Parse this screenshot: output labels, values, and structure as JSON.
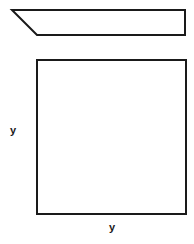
{
  "diagram": {
    "parallelogram": {
      "points": "12,10 185,10 185,35 37,35",
      "stroke": "#1a1a1a"
    },
    "square": {
      "x": 37,
      "y": 60,
      "width": 149,
      "height": 154,
      "stroke": "#1a1a1a"
    },
    "labels": {
      "left": "y",
      "bottom": "y"
    }
  }
}
